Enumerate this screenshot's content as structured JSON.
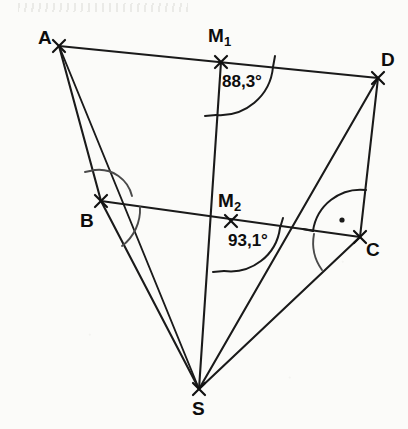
{
  "figure": {
    "width": 408,
    "height": 429,
    "background_color": "#fbfbf9",
    "stroke_color": "#1a1a1a"
  },
  "points": {
    "A": {
      "label": "A",
      "x": 59,
      "y": 46,
      "label_x": 38,
      "label_y": 28
    },
    "D": {
      "label": "D",
      "x": 378,
      "y": 78,
      "label_x": 381,
      "label_y": 50
    },
    "B": {
      "label": "B",
      "x": 101,
      "y": 201,
      "label_x": 80,
      "label_y": 211
    },
    "C": {
      "label": "C",
      "x": 360,
      "y": 237,
      "label_x": 366,
      "label_y": 240
    },
    "S": {
      "label": "S",
      "x": 199,
      "y": 389,
      "label_x": 192,
      "label_y": 399
    },
    "M1": {
      "label": "M",
      "subscript": "1",
      "x": 221,
      "y": 62,
      "label_x": 208,
      "label_y": 26
    },
    "M2": {
      "label": "M",
      "subscript": "2",
      "x": 231,
      "y": 221,
      "label_x": 218,
      "label_y": 191
    }
  },
  "segments": [
    {
      "name": "segment-A-D",
      "from": "A",
      "to": "D"
    },
    {
      "name": "segment-B-C",
      "from": "B",
      "to": "C"
    },
    {
      "name": "segment-A-B",
      "from": "A",
      "to": "B"
    },
    {
      "name": "segment-B-S",
      "from": "B",
      "to": "S"
    },
    {
      "name": "segment-A-S",
      "from": "A",
      "to": "S"
    },
    {
      "name": "segment-M1-S",
      "from": "M1",
      "to": "S"
    },
    {
      "name": "segment-D-C",
      "from": "D",
      "to": "C"
    },
    {
      "name": "segment-D-S",
      "from": "D",
      "to": "S"
    },
    {
      "name": "segment-C-S",
      "from": "C",
      "to": "S"
    }
  ],
  "angles": {
    "m1": {
      "value": "88,3°",
      "vertex": "M1",
      "label_x": 222,
      "label_y": 73
    },
    "m2": {
      "value": "93,1°",
      "vertex": "M2",
      "label_x": 228,
      "label_y": 232
    },
    "c_right": {
      "marker": "right-angle-dot",
      "vertex": "C"
    },
    "b_arcs": {
      "count": 2,
      "vertex": "B"
    },
    "c_arc": {
      "count": 1,
      "vertex": "C"
    }
  }
}
